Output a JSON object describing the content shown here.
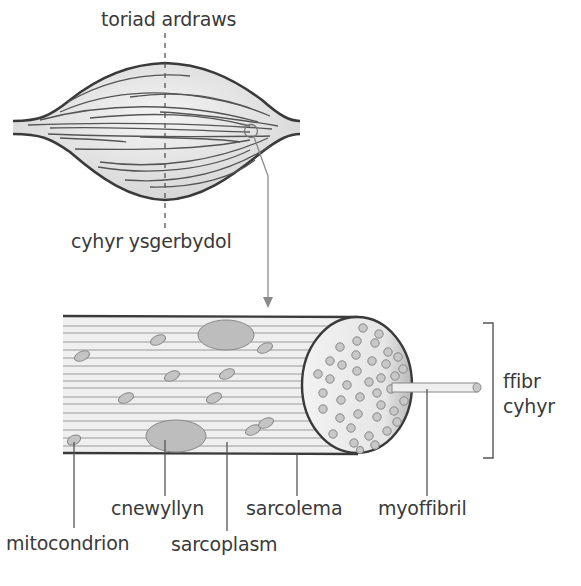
{
  "diagram": {
    "labels": {
      "cross_section": "toriad ardraws",
      "skeletal_muscle": "cyhyr ysgerbydol",
      "muscle_fibre_line1": "ffibr",
      "muscle_fibre_line2": "cyhyr",
      "nucleus": "cnewyllyn",
      "sarcolemma": "sarcolema",
      "myofibril": "myoffibril",
      "mitochondrion": "mitocondrion",
      "sarcoplasm": "sarcoplasm"
    },
    "colors": {
      "outline": "#3a3a3a",
      "fill": "#e8e8e8",
      "organelle": "#bdbdbd",
      "leader": "#555555",
      "arrow": "#8a8a8a"
    }
  }
}
